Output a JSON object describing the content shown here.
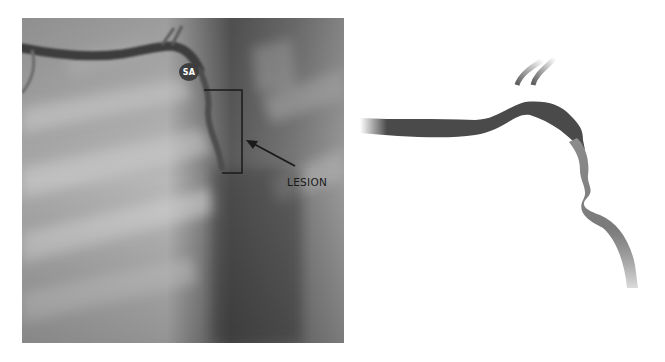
{
  "figure": {
    "panels": [
      {
        "id": "angiogram",
        "type": "x-ray angiography image",
        "labels": {
          "vessel_label": "SA",
          "annotation_label": "LESION"
        },
        "annotations": [
          "bracket",
          "arrow"
        ]
      },
      {
        "id": "schematic",
        "type": "vessel illustration"
      }
    ],
    "colors": {
      "vessel_dark": "#4a4a4a",
      "vessel_light": "#8c8c8c",
      "label_badge": "#3e3e3e",
      "annotation": "#1a1a1a",
      "background": "#ffffff"
    }
  }
}
